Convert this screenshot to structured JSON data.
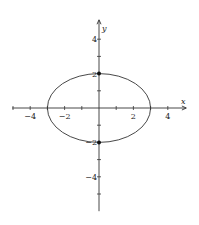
{
  "chart_data": {
    "type": "line",
    "title": "",
    "xlabel": "x",
    "ylabel": "y",
    "xlim": [
      -5,
      5
    ],
    "ylim": [
      -5,
      5
    ],
    "grid": false,
    "curve": {
      "name": "ellipse",
      "equation": "x^2/9 + y^2/4 = 1",
      "center": [
        0,
        0
      ],
      "semi_axis_x": 3,
      "semi_axis_y": 2
    },
    "points": [
      {
        "x": 0,
        "y": 2,
        "label": "2"
      },
      {
        "x": 0,
        "y": -2,
        "label": "-2"
      }
    ],
    "x_ticks": [
      -5,
      -4,
      -3,
      -2,
      -1,
      1,
      2,
      3,
      4
    ],
    "y_ticks": [
      -5,
      -4,
      -3,
      -2,
      -1,
      1,
      2,
      3,
      4
    ],
    "x_tick_labels": [
      {
        "value": -4,
        "text": "−4"
      },
      {
        "value": -2,
        "text": "−2"
      },
      {
        "value": 2,
        "text": "2"
      },
      {
        "value": 4,
        "text": "4"
      }
    ],
    "y_tick_labels": [
      {
        "value": 4,
        "text": "4"
      },
      {
        "value": 2,
        "text": "2"
      },
      {
        "value": -2,
        "text": "−2"
      },
      {
        "value": -4,
        "text": "−4"
      }
    ]
  }
}
